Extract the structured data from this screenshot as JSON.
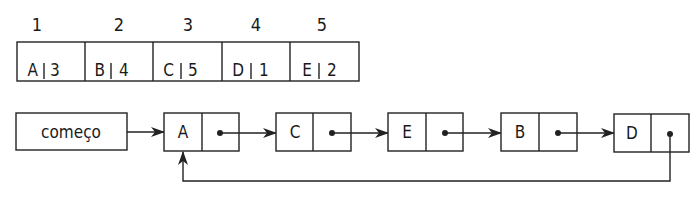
{
  "array": {
    "indices": [
      "1",
      "2",
      "3",
      "4",
      "5"
    ],
    "cells": [
      {
        "value": "A",
        "next": "3"
      },
      {
        "value": "B",
        "next": "4"
      },
      {
        "value": "C",
        "next": "5"
      },
      {
        "value": "D",
        "next": "1"
      },
      {
        "value": "E",
        "next": "2"
      }
    ]
  },
  "list": {
    "head_label": "começo",
    "nodes": [
      "A",
      "C",
      "E",
      "B",
      "D"
    ],
    "circular": true
  }
}
